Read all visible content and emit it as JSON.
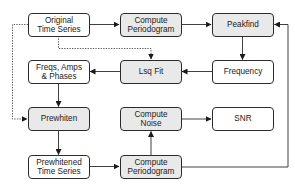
{
  "diagram": {
    "type": "flowchart",
    "colors": {
      "process_fill": "#e9e9e9",
      "data_fill": "#ffffff",
      "stroke": "#2b2b2b"
    },
    "nodes": [
      {
        "id": "original",
        "label": "Original\nTime Series",
        "kind": "data"
      },
      {
        "id": "periodogram1",
        "label": "Compute\nPeriodogram",
        "kind": "process"
      },
      {
        "id": "peakfind",
        "label": "Peakfind",
        "kind": "process"
      },
      {
        "id": "freqs",
        "label": "Freqs, Amps\n& Phases",
        "kind": "data"
      },
      {
        "id": "lsqfit",
        "label": "Lsq Fit",
        "kind": "process"
      },
      {
        "id": "frequency",
        "label": "Frequency",
        "kind": "data"
      },
      {
        "id": "prewhiten",
        "label": "Prewhiten",
        "kind": "process"
      },
      {
        "id": "noise",
        "label": "Compute\nNoise",
        "kind": "process"
      },
      {
        "id": "snr",
        "label": "SNR",
        "kind": "data"
      },
      {
        "id": "prewhitened",
        "label": "Prewhitened\nTime Series",
        "kind": "data"
      },
      {
        "id": "periodogram2",
        "label": "Compute\nPeriodogram",
        "kind": "process"
      }
    ],
    "edges": [
      {
        "from": "original",
        "to": "periodogram1",
        "style": "solid"
      },
      {
        "from": "periodogram1",
        "to": "peakfind",
        "style": "solid"
      },
      {
        "from": "peakfind",
        "to": "frequency",
        "style": "solid"
      },
      {
        "from": "frequency",
        "to": "lsqfit",
        "style": "solid"
      },
      {
        "from": "lsqfit",
        "to": "freqs",
        "style": "solid"
      },
      {
        "from": "original",
        "to": "lsqfit",
        "style": "dotted"
      },
      {
        "from": "original",
        "to": "prewhiten",
        "style": "dotted"
      },
      {
        "from": "freqs",
        "to": "prewhiten",
        "style": "solid"
      },
      {
        "from": "prewhiten",
        "to": "prewhitened",
        "style": "solid"
      },
      {
        "from": "prewhitened",
        "to": "periodogram2",
        "style": "solid"
      },
      {
        "from": "periodogram2",
        "to": "noise",
        "style": "solid"
      },
      {
        "from": "noise",
        "to": "snr",
        "style": "solid"
      },
      {
        "from": "periodogram2",
        "to": "peakfind",
        "style": "solid"
      }
    ]
  }
}
